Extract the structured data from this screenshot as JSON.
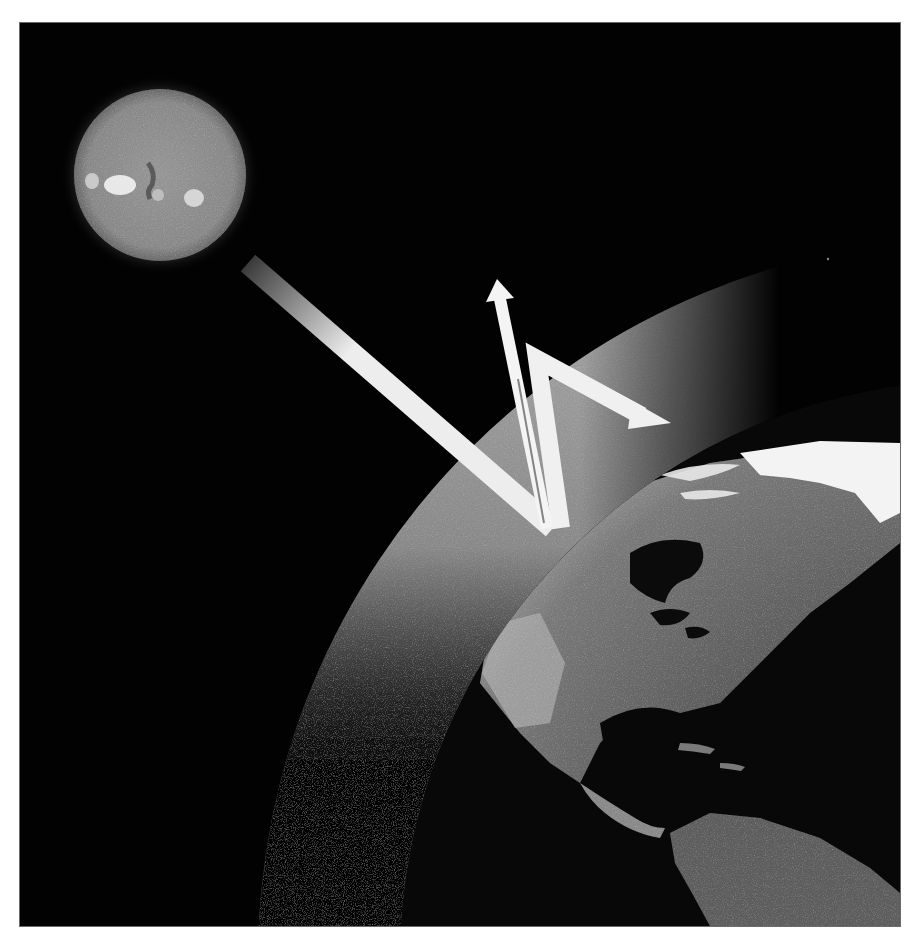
{
  "figure": {
    "subject": "Greenhouse effect illustration",
    "background_color": "#020202",
    "frame_color": "#6a6a6a"
  },
  "elements": {
    "sun": {
      "label": "Sun",
      "center": [
        140,
        152
      ],
      "radius": 86,
      "fill": "#8a8a8a"
    },
    "incoming_ray": {
      "label": "Incoming solar radiation",
      "from": [
        228,
        240
      ],
      "to": [
        533,
        505
      ],
      "width": 22,
      "color": "#f0f0f0"
    },
    "escaping_ray": {
      "label": "Radiation escaping to space",
      "from": [
        533,
        505
      ],
      "to": [
        477,
        256
      ],
      "width": 12,
      "color": "#f2f2f2"
    },
    "trapped_ray": {
      "label": "Radiation re-radiated by atmosphere",
      "points": [
        [
          533,
          505
        ],
        [
          517,
          332
        ],
        [
          631,
          397
        ]
      ],
      "width": 18,
      "color": "#f2f2f2"
    },
    "atmosphere": {
      "label": "Atmosphere",
      "center": [
        960,
        937
      ],
      "radius": 722,
      "color": "#9a9a9a"
    },
    "earth": {
      "label": "Earth",
      "center": [
        960,
        937
      ],
      "radius": 580,
      "ocean": "#0a0a0a",
      "land": "#6e6e6e",
      "ice": "#f4f4f4"
    },
    "star": {
      "center": [
        808,
        236
      ],
      "radius": 1.2
    }
  }
}
